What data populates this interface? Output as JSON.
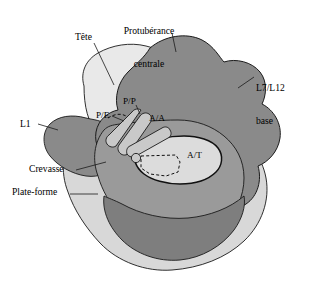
{
  "figure": {
    "type": "anatomical-schematic",
    "background_color": "#ffffff",
    "outline_color": "#1a1a1a"
  },
  "palette": {
    "head_light": "#e9e9e9",
    "platform_light": "#d8d8d8",
    "body_mid": "#9a9a9a",
    "base_dark": "#848484",
    "lobe_dark": "#7e7e7e",
    "patch_light": "#dcdcdc",
    "rod_fill": "#c9c9c9",
    "line": "#1a1a1a"
  },
  "labels": {
    "outer": [
      {
        "id": "protuberance-centrale",
        "text": "Protubérance\ncentrale",
        "line1": "Protubérance",
        "line2": "centrale",
        "x": 148,
        "y": 6,
        "align": "center"
      },
      {
        "id": "tete",
        "text": "Tête",
        "x": 75,
        "y": 33,
        "align": "left"
      },
      {
        "id": "l7-l12-base",
        "text": "L7/L12\nbase",
        "line1": "L7/L12",
        "line2": "base",
        "x": 255,
        "y": 63,
        "align": "left"
      },
      {
        "id": "l1",
        "text": "L1",
        "x": 20,
        "y": 122,
        "align": "left"
      },
      {
        "id": "crevasse",
        "text": "Crevasse",
        "x": 30,
        "y": 167,
        "align": "left"
      },
      {
        "id": "plate-forme",
        "text": "Plate-forme",
        "x": 13,
        "y": 190,
        "align": "left"
      }
    ],
    "inner": [
      {
        "id": "p-e-site",
        "text": "P/E",
        "x": 97,
        "y": 113
      },
      {
        "id": "p-p-site",
        "text": "P/P",
        "x": 124,
        "y": 99
      },
      {
        "id": "a-a-site",
        "text": "A/A",
        "x": 150,
        "y": 116
      },
      {
        "id": "a-t-site",
        "text": "A/T",
        "x": 188,
        "y": 153
      }
    ]
  }
}
